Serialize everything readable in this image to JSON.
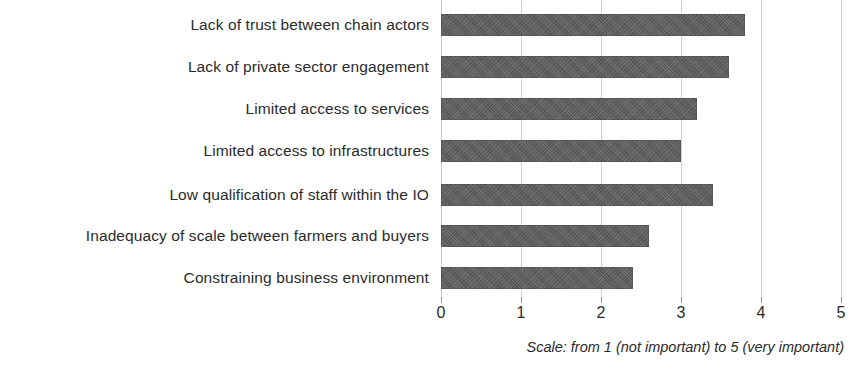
{
  "chart_data": {
    "type": "bar",
    "orientation": "horizontal",
    "title": "",
    "xlabel": "",
    "ylabel": "",
    "xlim": [
      0,
      5
    ],
    "grid": true,
    "legend": null,
    "categories": [
      "Lack of trust between chain actors",
      "Lack of private sector engagement",
      "Limited access to services",
      "Limited access to infrastructures",
      "Low qualification of staff within the IO",
      "Inadequacy of scale between farmers and buyers",
      "Constraining business environment"
    ],
    "values": [
      3.8,
      3.6,
      3.2,
      3.0,
      3.4,
      2.6,
      2.4
    ],
    "xticks": [
      "0",
      "1",
      "2",
      "3",
      "4",
      "5"
    ],
    "xtick_values": [
      0,
      1,
      2,
      3,
      4,
      5
    ],
    "bar_color": "#5d5d5d",
    "gridline_color": "#d2d2d2",
    "caption": "Scale: from 1 (not important) to 5 (very important)"
  }
}
